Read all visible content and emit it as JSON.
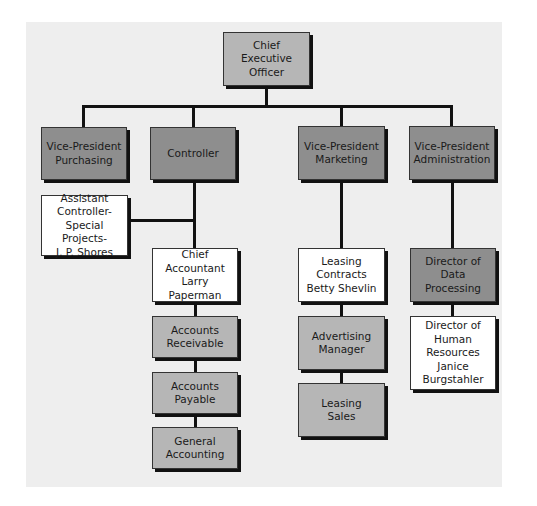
{
  "chart": {
    "type": "org-chart",
    "nodes": {
      "ceo": {
        "label": "Chief Executive\nOfficer"
      },
      "vp_purchasing": {
        "label": "Vice-President\nPurchasing"
      },
      "controller": {
        "label": "Controller"
      },
      "vp_marketing": {
        "label": "Vice-President\nMarketing"
      },
      "vp_administration": {
        "label": "Vice-President\nAdministration"
      },
      "assistant_controller": {
        "label": "Assistant\nController-\nSpecial Projects-\nJ. P. Shores"
      },
      "chief_accountant": {
        "label": "Chief\nAccountant\nLarry Paperman"
      },
      "accounts_receivable": {
        "label": "Accounts\nReceivable"
      },
      "accounts_payable": {
        "label": "Accounts\nPayable"
      },
      "general_accounting": {
        "label": "General\nAccounting"
      },
      "leasing_contracts": {
        "label": "Leasing\nContracts\nBetty Shevlin"
      },
      "advertising_manager": {
        "label": "Advertising\nManager"
      },
      "leasing_sales": {
        "label": "Leasing\nSales"
      },
      "director_data_processing": {
        "label": "Director of\nData\nProcessing"
      },
      "director_human_resources": {
        "label": "Director of\nHuman\nResources\nJanice\nBurgstahler"
      }
    },
    "edges": [
      [
        "ceo",
        "vp_purchasing"
      ],
      [
        "ceo",
        "controller"
      ],
      [
        "ceo",
        "vp_marketing"
      ],
      [
        "ceo",
        "vp_administration"
      ],
      [
        "controller",
        "assistant_controller"
      ],
      [
        "controller",
        "chief_accountant"
      ],
      [
        "chief_accountant",
        "accounts_receivable"
      ],
      [
        "accounts_receivable",
        "accounts_payable"
      ],
      [
        "accounts_payable",
        "general_accounting"
      ],
      [
        "vp_marketing",
        "leasing_contracts"
      ],
      [
        "leasing_contracts",
        "advertising_manager"
      ],
      [
        "advertising_manager",
        "leasing_sales"
      ],
      [
        "vp_administration",
        "director_data_processing"
      ],
      [
        "director_data_processing",
        "director_human_resources"
      ]
    ],
    "colors": {
      "panel": "#eeeeee",
      "light_box": "#b6b6b6",
      "dark_box": "#8e8e8e",
      "white_box": "#ffffff",
      "line": "#111111"
    }
  }
}
